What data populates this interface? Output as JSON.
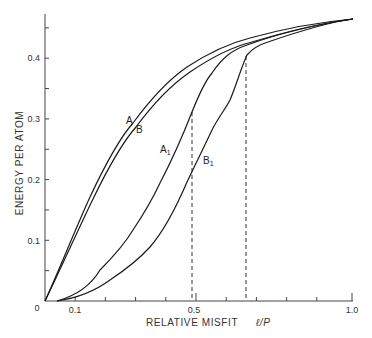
{
  "chart_data": {
    "type": "line",
    "title": "",
    "xlabel": "RELATIVE MISFIT",
    "xlabel_symbol": "ℓ/P",
    "ylabel": "ENERGY PER ATOM",
    "xlim": [
      0,
      1.0
    ],
    "ylim": [
      0,
      0.47
    ],
    "grid": false,
    "legend": "inline curve labels",
    "x_ticks": [
      0,
      0.1,
      0.2,
      0.3,
      0.4,
      0.5,
      0.6,
      0.7,
      0.8,
      0.9,
      1.0
    ],
    "x_tick_labels": {
      "0": "0",
      "0.1": "0.1",
      "0.5": "0.5",
      "1.0": "1.0"
    },
    "y_ticks": [
      0,
      0.05,
      0.1,
      0.15,
      0.2,
      0.25,
      0.3,
      0.35,
      0.4,
      0.45
    ],
    "y_tick_labels": {
      "0.1": "0.1",
      "0.2": "0.2",
      "0.3": "0.3",
      "0.4": "0.4"
    },
    "origin_label": "0",
    "series": [
      {
        "name": "A",
        "x": [
          0,
          0.05,
          0.1,
          0.15,
          0.2,
          0.3,
          0.4,
          0.5,
          0.6,
          0.7,
          0.8,
          0.9,
          1.0
        ],
        "y": [
          0,
          0.062,
          0.12,
          0.17,
          0.213,
          0.297,
          0.356,
          0.397,
          0.424,
          0.44,
          0.452,
          0.46,
          0.465
        ]
      },
      {
        "name": "B",
        "x": [
          0,
          0.05,
          0.1,
          0.15,
          0.2,
          0.3,
          0.4,
          0.5,
          0.6,
          0.7,
          0.8,
          0.9,
          1.0
        ],
        "y": [
          0,
          0.06,
          0.115,
          0.163,
          0.205,
          0.288,
          0.347,
          0.389,
          0.418,
          0.436,
          0.45,
          0.459,
          0.465
        ]
      },
      {
        "name": "A₁",
        "x": [
          0.04,
          0.1,
          0.2,
          0.3,
          0.37,
          0.4,
          0.45,
          0.485,
          0.55,
          0.6,
          0.66,
          0.75,
          0.85,
          1.0
        ],
        "y": [
          0,
          0.012,
          0.048,
          0.1,
          0.14,
          0.165,
          0.22,
          0.31,
          0.375,
          0.4,
          0.42,
          0.437,
          0.452,
          0.465
        ]
      },
      {
        "name": "B₁",
        "x": [
          0.04,
          0.1,
          0.2,
          0.3,
          0.4,
          0.45,
          0.49,
          0.55,
          0.6,
          0.66,
          0.7,
          0.8,
          0.9,
          1.0
        ],
        "y": [
          0,
          0.01,
          0.038,
          0.083,
          0.145,
          0.18,
          0.22,
          0.285,
          0.343,
          0.405,
          0.42,
          0.44,
          0.455,
          0.465
        ]
      }
    ],
    "annotations": [
      {
        "type": "vline",
        "style": "dashed",
        "x": 0.485,
        "y_top": 0.31
      },
      {
        "type": "vline",
        "style": "dashed",
        "x": 0.665,
        "y_top": 0.405
      }
    ]
  },
  "labels": {
    "y_axis": "ENERGY PER ATOM",
    "x_axis": "RELATIVE MISFIT",
    "x_symbol": "ℓ/P",
    "origin": "0",
    "x_tick_01": "0.1",
    "x_tick_05": "0.5",
    "x_tick_10": "1.0",
    "y_tick_01": "0.1",
    "y_tick_02": "0.2",
    "y_tick_03": "0.3",
    "y_tick_04": "0.4",
    "curve_A": "A",
    "curve_B": "B",
    "curve_A1": "A",
    "curve_B1": "B",
    "subscript_1": "1"
  }
}
